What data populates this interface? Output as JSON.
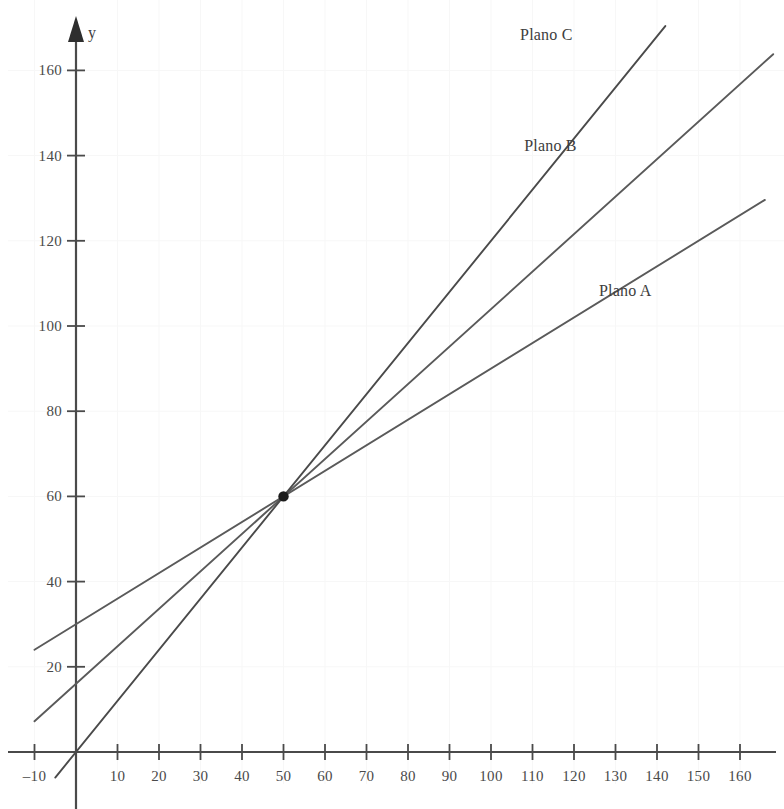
{
  "chart_data": {
    "type": "line",
    "title": "",
    "xlabel": "",
    "ylabel": "y",
    "xlim": [
      -12,
      172
    ],
    "ylim": [
      -14,
      174
    ],
    "grid": true,
    "legend_position": "inline-right-of-line-ends",
    "xticks": [
      -10,
      10,
      20,
      30,
      40,
      50,
      60,
      70,
      80,
      90,
      100,
      110,
      120,
      130,
      140,
      150,
      160
    ],
    "xtick_labels": [
      "–10",
      "10",
      "20",
      "30",
      "40",
      "50",
      "60",
      "70",
      "80",
      "90",
      "100",
      "110",
      "120",
      "130",
      "140",
      "150",
      "160"
    ],
    "yticks": [
      20,
      40,
      60,
      80,
      100,
      120,
      140,
      160
    ],
    "ytick_labels": [
      "20",
      "40",
      "60",
      "80",
      "100",
      "120",
      "140",
      "160"
    ],
    "intersection_point": {
      "x": 50,
      "y": 60,
      "label": ""
    },
    "series": [
      {
        "name": "Plano A",
        "color": "#5a5a5a",
        "intercept": 30,
        "slope": 0.6,
        "x": [
          -10,
          166
        ],
        "y": [
          24,
          129.6
        ],
        "label_x": 126,
        "label_y": 108
      },
      {
        "name": "Plano B",
        "color": "#5a5a5a",
        "intercept": 16,
        "slope": 0.88,
        "x": [
          -10,
          168
        ],
        "y": [
          7.2,
          163.8
        ],
        "label_x": 108,
        "label_y": 142
      },
      {
        "name": "Plano C",
        "color": "#4a4a4a",
        "intercept": 0,
        "slope": 1.2,
        "x": [
          -5,
          142
        ],
        "y": [
          -6,
          170.4
        ],
        "label_x": 107,
        "label_y": 168
      }
    ]
  },
  "axes": {
    "y_axis_name": "y",
    "y_arrow": "arrow-up"
  }
}
